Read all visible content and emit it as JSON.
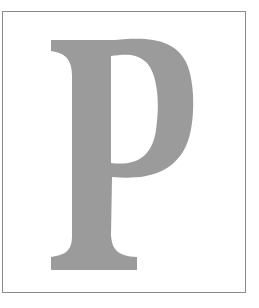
{
  "initial": {
    "letter": "P",
    "fill_color": "#9b9b9b",
    "border_color": "#8a8a8a",
    "background": "#ffffff"
  }
}
